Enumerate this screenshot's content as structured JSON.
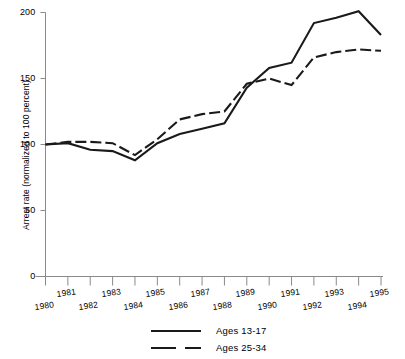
{
  "chart_data": {
    "type": "line",
    "title": "",
    "subtitle": "",
    "xlabel": "",
    "ylabel": "Arrest rate (normalized to 100 percent)",
    "x": [
      1980,
      1981,
      1982,
      1983,
      1984,
      1985,
      1986,
      1987,
      1988,
      1989,
      1990,
      1991,
      1992,
      1993,
      1994,
      1995
    ],
    "xtick_labels": [
      "1980",
      "1981",
      "1982",
      "1983",
      "1984",
      "1985",
      "1986",
      "1987",
      "1988",
      "1989",
      "1990",
      "1991",
      "1992",
      "1993",
      "1994",
      "1995"
    ],
    "ytick_labels": [
      "0",
      "50",
      "100",
      "150",
      "200"
    ],
    "yticks": [
      0,
      50,
      100,
      150,
      200
    ],
    "xlim": [
      1980,
      1995
    ],
    "ylim": [
      0,
      200
    ],
    "grid": false,
    "legend_position": "bottom",
    "series": [
      {
        "name": "Ages 13-17",
        "style": "solid",
        "color": "#1a1a1a",
        "values": [
          100,
          101,
          96,
          95,
          88,
          101,
          108,
          112,
          116,
          143,
          158,
          162,
          192,
          196,
          201,
          183
        ]
      },
      {
        "name": "Ages 25-34",
        "style": "dashed",
        "color": "#1a1a1a",
        "values": [
          100,
          102,
          102,
          101,
          92,
          104,
          119,
          123,
          125,
          146,
          150,
          145,
          166,
          170,
          172,
          171
        ]
      }
    ]
  },
  "axis": {
    "y_axis_label": "Arrest rate (normalized to 100 percent)"
  },
  "legend": {
    "items": [
      {
        "label": "Ages 13-17",
        "style": "solid"
      },
      {
        "label": "Ages 25-34",
        "style": "dashed"
      }
    ]
  }
}
